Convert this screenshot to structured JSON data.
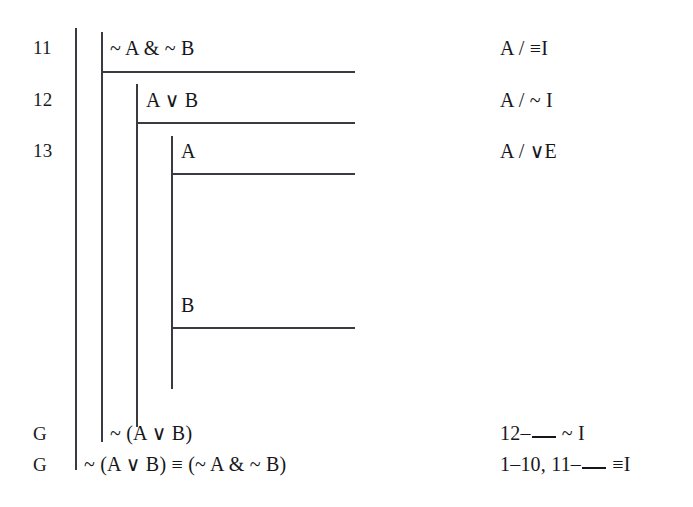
{
  "document": {
    "kind": "natural-deduction-proof",
    "background_color": "#ffffff",
    "ink_color": "#17171b",
    "rule_color": "#3a3a40"
  },
  "rows": [
    {
      "label": "11",
      "formula": "~ A & ~ B",
      "justification_prefix": "A / ",
      "justification_rule": "≡I",
      "justification_full": "A / ≡I"
    },
    {
      "label": "12",
      "formula": "A ∨ B",
      "justification_prefix": "A / ",
      "justification_rule": "~ I",
      "justification_full": "A / ~ I"
    },
    {
      "label": "13",
      "formula": "A",
      "justification_prefix": "A / ",
      "justification_rule": "∨E",
      "justification_full": "A / ∨E"
    },
    {
      "label": "",
      "formula": "B",
      "justification_prefix": "",
      "justification_rule": "",
      "justification_full": ""
    }
  ],
  "goals": [
    {
      "label": "G",
      "formula": "~ (A ∨ B)",
      "justification_before_blank": "12–",
      "justification_after_blank": "~ I"
    },
    {
      "label": "G",
      "formula": "~ (A ∨ B) ≡ (~ A & ~ B)",
      "justification_before_blank": "1–10, 11–",
      "justification_after_blank": "≡I"
    }
  ],
  "scope_bars": [
    {
      "name": "outer-proof-scope-bar"
    },
    {
      "name": "negation-intro-scope-bar"
    },
    {
      "name": "disjunction-elim-scope-bar"
    },
    {
      "name": "case-a-scope-bar"
    },
    {
      "name": "case-b-scope-bar"
    }
  ],
  "assumption_rules": [
    {
      "name": "assumption-rule-line-11"
    },
    {
      "name": "assumption-rule-line-12"
    },
    {
      "name": "assumption-rule-line-13"
    },
    {
      "name": "assumption-rule-case-b"
    }
  ]
}
